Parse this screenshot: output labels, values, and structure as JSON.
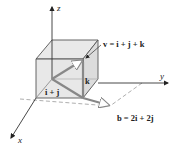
{
  "figure": {
    "axes": {
      "x_label": "x",
      "y_label": "y",
      "z_label": "z"
    },
    "vectors": {
      "v_label": "v = i + j + k",
      "k_label": "k",
      "ij_label": "i + j",
      "b_label": "b = 2i + 2j"
    },
    "colors": {
      "cube_face": "#e6e6e6",
      "cube_edge": "#555555",
      "vector": "#888888",
      "axis": "#333333",
      "dashed": "#999999"
    }
  }
}
